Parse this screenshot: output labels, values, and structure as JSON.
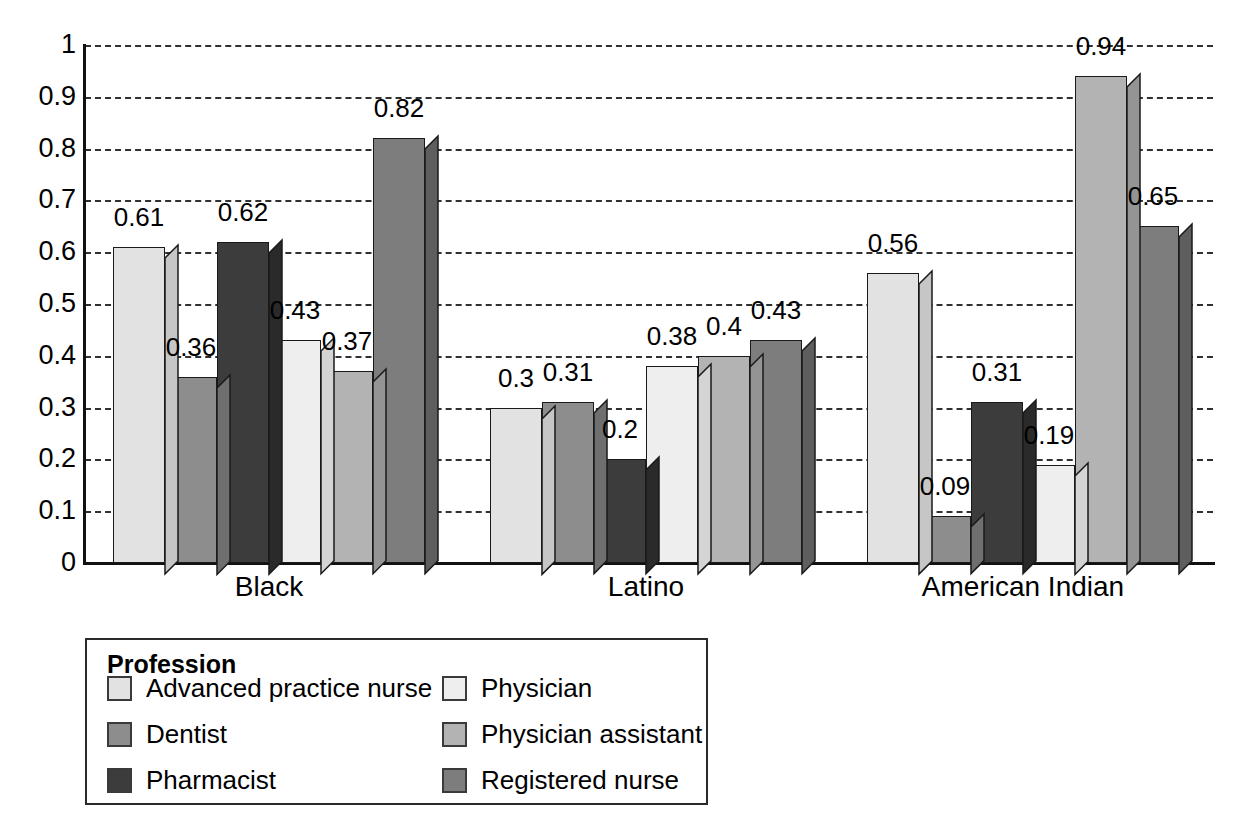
{
  "chart_data": {
    "type": "bar",
    "title": "",
    "subtitle": "",
    "xlabel": "",
    "ylabel": "",
    "ylim": [
      0,
      1
    ],
    "ytick_labels": [
      "1",
      "0.9",
      "0.8",
      "0.7",
      "0.6",
      "0.5",
      "0.4",
      "0.3",
      "0.2",
      "0.1",
      "0"
    ],
    "ytick_values": [
      1,
      0.9,
      0.8,
      0.7,
      0.6,
      0.5,
      0.4,
      0.3,
      0.2,
      0.1,
      0
    ],
    "grid": "horizontal-dashed",
    "legend_position": "below-left",
    "legend_title": "Profession",
    "categories": [
      "Black",
      "Latino",
      "American Indian"
    ],
    "series": [
      {
        "name": "Advanced practice nurse",
        "color": "#e2e2e2",
        "side_color": "#c6c6c6",
        "values": [
          0.61,
          0.3,
          0.56
        ],
        "labels": [
          "0.61",
          "0.3",
          "0.56"
        ]
      },
      {
        "name": "Dentist",
        "color": "#8d8d8d",
        "side_color": "#6f6f6f",
        "values": [
          0.36,
          0.31,
          0.09
        ],
        "labels": [
          "0.36",
          "0.31",
          "0.09"
        ]
      },
      {
        "name": "Pharmacist",
        "color": "#3c3c3c",
        "side_color": "#2a2a2a",
        "values": [
          0.62,
          0.2,
          0.31
        ],
        "labels": [
          "0.62",
          "0.2",
          "0.31"
        ]
      },
      {
        "name": "Physician",
        "color": "#eeeeee",
        "side_color": "#d4d4d4",
        "values": [
          0.43,
          0.38,
          0.19
        ],
        "labels": [
          "0.43",
          "0.38",
          "0.19"
        ]
      },
      {
        "name": "Physician assistant",
        "color": "#b3b3b3",
        "side_color": "#949494",
        "values": [
          0.37,
          0.4,
          0.94
        ],
        "labels": [
          "0.37",
          "0.4",
          "0.94"
        ]
      },
      {
        "name": "Registered nurse",
        "color": "#7d7d7d",
        "side_color": "#5e5e5e",
        "values": [
          0.82,
          0.43,
          0.65
        ],
        "labels": [
          "0.82",
          "0.43",
          "0.65"
        ]
      }
    ]
  }
}
